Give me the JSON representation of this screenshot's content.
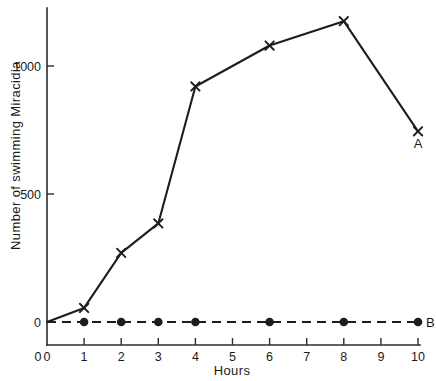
{
  "chart_data": {
    "type": "line",
    "title": "",
    "xlabel": "Hours",
    "ylabel": "Number of swimming Miracidia",
    "xlim": [
      0,
      10
    ],
    "ylim": [
      0,
      1260
    ],
    "xticks": [
      "0",
      "1",
      "2",
      "3",
      "4",
      "5",
      "6",
      "7",
      "8",
      "9",
      "10"
    ],
    "xtick_values": [
      0,
      1,
      2,
      3,
      4,
      5,
      6,
      7,
      8,
      9,
      10
    ],
    "yticks": [
      "0",
      "500",
      "1000"
    ],
    "ytick_values": [
      0,
      500,
      1000
    ],
    "grid": false,
    "legend_position": "inline-end-labels",
    "series": [
      {
        "name": "A",
        "label": "A",
        "marker": "x",
        "linestyle": "solid",
        "x": [
          0,
          1,
          2,
          3,
          4,
          6,
          8,
          10
        ],
        "values": [
          0,
          55,
          270,
          385,
          920,
          1080,
          1175,
          745
        ]
      },
      {
        "name": "B",
        "label": "B",
        "marker": "filled-circle",
        "linestyle": "dashed",
        "x": [
          0,
          1,
          2,
          3,
          4,
          6,
          8,
          10
        ],
        "values": [
          0,
          0,
          0,
          0,
          0,
          0,
          0,
          0
        ]
      }
    ]
  },
  "figure": {
    "caption": "",
    "axis_origin_label": "0"
  }
}
